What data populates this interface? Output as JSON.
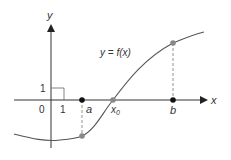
{
  "figure": {
    "axes": {
      "x_label": "x",
      "y_label": "y",
      "origin_label": "0",
      "x_tick_label": "1",
      "y_tick_label": "1"
    },
    "curve_label": "y = f(x)",
    "points": {
      "a": "a",
      "x0": "x",
      "x0_sub": "0",
      "b": "b"
    },
    "colors": {
      "axis": "#333333",
      "curve": "#555555",
      "point_on_axis": "#111111",
      "point_on_curve": "#888888",
      "dashed": "#777777"
    }
  }
}
